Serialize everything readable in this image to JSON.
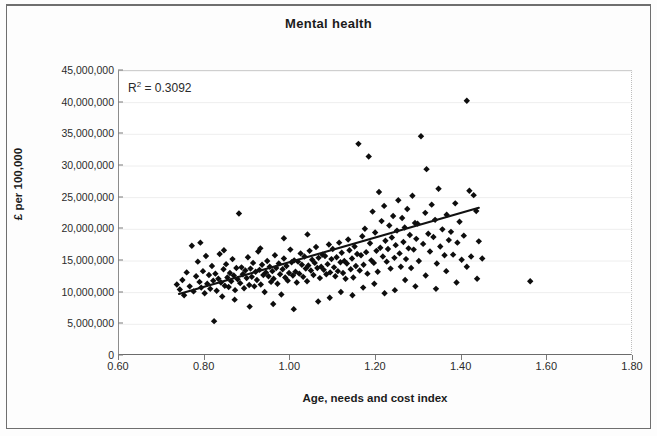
{
  "figure": {
    "title": "Mental health",
    "annotation_prefix": "R",
    "annotation_sup": "2",
    "annotation_value": "= 0.3092",
    "annotation_full": "R2 = 0.3092"
  },
  "axes": {
    "x_title": "Age, needs and cost index",
    "y_title": "£ per 100,000",
    "x_ticks": [
      "0.60",
      "0.80",
      "1.00",
      "1.20",
      "1.40",
      "1.60",
      "1.80"
    ],
    "y_ticks": [
      "0",
      "5,000,000",
      "10,000,000",
      "15,000,000",
      "20,000,000",
      "25,000,000",
      "30,000,000",
      "35,000,000",
      "40,000,000",
      "45,000,000"
    ]
  },
  "colors": {
    "marker": "#0d0d0d",
    "trendline": "#111111",
    "gridline": "#eeeeee",
    "frame": "#6f6f6f",
    "text": "#1b1b1b"
  },
  "chart_data": {
    "type": "scatter",
    "title": "Mental health",
    "xlabel": "Age, needs and cost index",
    "ylabel": "£ per 100,000",
    "xlim": [
      0.6,
      1.8
    ],
    "ylim": [
      0,
      45000000
    ],
    "xticks": [
      0.6,
      0.8,
      1.0,
      1.2,
      1.4,
      1.6,
      1.8
    ],
    "yticks": [
      0,
      5000000,
      10000000,
      15000000,
      20000000,
      25000000,
      30000000,
      35000000,
      40000000,
      45000000
    ],
    "grid": true,
    "legend": "none",
    "annotations": [
      {
        "text": "R2 = 0.3092",
        "x": 0.625,
        "y": 42200000,
        "r_squared": 0.3092
      }
    ],
    "trendline": {
      "type": "linear",
      "x_start": 0.74,
      "y_start": 9800000,
      "x_end": 1.44,
      "y_end": 23400000,
      "slope": 19430000,
      "intercept": -4580000
    },
    "marker_style": "diamond",
    "n_points": 236,
    "points": [
      [
        0.735,
        11300000
      ],
      [
        0.742,
        10500000
      ],
      [
        0.748,
        12000000
      ],
      [
        0.752,
        9600000
      ],
      [
        0.758,
        13200000
      ],
      [
        0.765,
        11000000
      ],
      [
        0.77,
        17400000
      ],
      [
        0.774,
        10200000
      ],
      [
        0.78,
        12600000
      ],
      [
        0.784,
        14900000
      ],
      [
        0.788,
        11700000
      ],
      [
        0.792,
        10800000
      ],
      [
        0.796,
        13400000
      ],
      [
        0.8,
        9900000
      ],
      [
        0.803,
        15800000
      ],
      [
        0.806,
        11400000
      ],
      [
        0.81,
        12800000
      ],
      [
        0.813,
        10600000
      ],
      [
        0.817,
        14200000
      ],
      [
        0.82,
        11900000
      ],
      [
        0.822,
        5500000
      ],
      [
        0.825,
        13000000
      ],
      [
        0.828,
        10300000
      ],
      [
        0.832,
        12200000
      ],
      [
        0.835,
        16100000
      ],
      [
        0.838,
        11600000
      ],
      [
        0.841,
        9400000
      ],
      [
        0.844,
        13700000
      ],
      [
        0.847,
        11100000
      ],
      [
        0.85,
        14500000
      ],
      [
        0.853,
        12400000
      ],
      [
        0.856,
        10900000
      ],
      [
        0.859,
        13100000
      ],
      [
        0.862,
        11800000
      ],
      [
        0.865,
        15300000
      ],
      [
        0.868,
        12700000
      ],
      [
        0.871,
        10400000
      ],
      [
        0.874,
        13900000
      ],
      [
        0.877,
        12100000
      ],
      [
        0.88,
        22500000
      ],
      [
        0.883,
        11500000
      ],
      [
        0.886,
        14000000
      ],
      [
        0.889,
        12900000
      ],
      [
        0.892,
        10700000
      ],
      [
        0.895,
        13500000
      ],
      [
        0.898,
        12300000
      ],
      [
        0.901,
        15600000
      ],
      [
        0.904,
        11200000
      ],
      [
        0.907,
        13800000
      ],
      [
        0.91,
        12500000
      ],
      [
        0.913,
        14700000
      ],
      [
        0.916,
        11000000
      ],
      [
        0.919,
        13300000
      ],
      [
        0.922,
        12000000
      ],
      [
        0.925,
        16500000
      ],
      [
        0.928,
        13600000
      ],
      [
        0.931,
        11300000
      ],
      [
        0.934,
        14400000
      ],
      [
        0.937,
        12800000
      ],
      [
        0.94,
        10100000
      ],
      [
        0.943,
        13200000
      ],
      [
        0.946,
        15000000
      ],
      [
        0.949,
        12600000
      ],
      [
        0.952,
        14100000
      ],
      [
        0.955,
        11700000
      ],
      [
        0.958,
        13400000
      ],
      [
        0.961,
        12200000
      ],
      [
        0.964,
        15900000
      ],
      [
        0.967,
        13900000
      ],
      [
        0.97,
        11400000
      ],
      [
        0.973,
        14600000
      ],
      [
        0.976,
        12900000
      ],
      [
        0.979,
        9700000
      ],
      [
        0.982,
        13700000
      ],
      [
        0.985,
        15400000
      ],
      [
        0.988,
        12400000
      ],
      [
        0.991,
        14200000
      ],
      [
        0.994,
        11900000
      ],
      [
        0.997,
        13100000
      ],
      [
        1.0,
        16800000
      ],
      [
        1.003,
        14800000
      ],
      [
        1.006,
        12700000
      ],
      [
        1.009,
        15100000
      ],
      [
        1.012,
        13300000
      ],
      [
        1.015,
        11600000
      ],
      [
        1.018,
        14900000
      ],
      [
        1.021,
        13000000
      ],
      [
        1.024,
        16200000
      ],
      [
        1.027,
        14400000
      ],
      [
        1.03,
        12500000
      ],
      [
        1.033,
        15700000
      ],
      [
        1.036,
        13800000
      ],
      [
        1.039,
        11800000
      ],
      [
        1.042,
        14300000
      ],
      [
        1.045,
        16600000
      ],
      [
        1.048,
        13500000
      ],
      [
        1.051,
        15200000
      ],
      [
        1.054,
        12800000
      ],
      [
        1.057,
        14700000
      ],
      [
        1.06,
        17200000
      ],
      [
        1.063,
        13900000
      ],
      [
        1.066,
        15500000
      ],
      [
        1.069,
        12300000
      ],
      [
        1.072,
        14100000
      ],
      [
        1.075,
        16000000
      ],
      [
        1.078,
        13600000
      ],
      [
        1.081,
        15800000
      ],
      [
        1.084,
        12900000
      ],
      [
        1.087,
        14500000
      ],
      [
        1.09,
        17600000
      ],
      [
        1.093,
        13200000
      ],
      [
        1.096,
        15300000
      ],
      [
        1.099,
        16900000
      ],
      [
        1.102,
        14000000
      ],
      [
        1.105,
        12600000
      ],
      [
        1.108,
        15600000
      ],
      [
        1.111,
        13400000
      ],
      [
        1.114,
        17900000
      ],
      [
        1.117,
        14800000
      ],
      [
        1.12,
        16300000
      ],
      [
        1.123,
        13100000
      ],
      [
        1.126,
        15000000
      ],
      [
        1.129,
        12200000
      ],
      [
        1.132,
        14600000
      ],
      [
        1.135,
        18400000
      ],
      [
        1.138,
        16700000
      ],
      [
        1.141,
        13700000
      ],
      [
        1.144,
        15400000
      ],
      [
        1.147,
        12400000
      ],
      [
        1.15,
        17300000
      ],
      [
        1.153,
        14200000
      ],
      [
        1.156,
        16100000
      ],
      [
        1.159,
        33500000
      ],
      [
        1.162,
        13500000
      ],
      [
        1.165,
        15900000
      ],
      [
        1.168,
        18900000
      ],
      [
        1.171,
        14400000
      ],
      [
        1.174,
        20100000
      ],
      [
        1.177,
        16400000
      ],
      [
        1.18,
        13000000
      ],
      [
        1.183,
        31500000
      ],
      [
        1.186,
        17800000
      ],
      [
        1.189,
        15100000
      ],
      [
        1.192,
        22800000
      ],
      [
        1.195,
        14700000
      ],
      [
        1.198,
        19500000
      ],
      [
        1.201,
        16600000
      ],
      [
        1.204,
        13300000
      ],
      [
        1.207,
        25900000
      ],
      [
        1.21,
        17100000
      ],
      [
        1.213,
        21300000
      ],
      [
        1.216,
        15700000
      ],
      [
        1.219,
        23700000
      ],
      [
        1.222,
        18200000
      ],
      [
        1.225,
        14900000
      ],
      [
        1.228,
        16900000
      ],
      [
        1.231,
        20600000
      ],
      [
        1.234,
        13800000
      ],
      [
        1.237,
        18700000
      ],
      [
        1.24,
        22100000
      ],
      [
        1.243,
        15500000
      ],
      [
        1.246,
        17500000
      ],
      [
        1.249,
        19800000
      ],
      [
        1.252,
        24600000
      ],
      [
        1.255,
        16200000
      ],
      [
        1.258,
        14100000
      ],
      [
        1.261,
        21800000
      ],
      [
        1.264,
        18000000
      ],
      [
        1.267,
        20300000
      ],
      [
        1.27,
        15300000
      ],
      [
        1.273,
        23200000
      ],
      [
        1.276,
        17000000
      ],
      [
        1.279,
        19100000
      ],
      [
        1.282,
        13900000
      ],
      [
        1.285,
        25300000
      ],
      [
        1.288,
        16800000
      ],
      [
        1.291,
        21000000
      ],
      [
        1.294,
        18500000
      ],
      [
        1.297,
        20900000
      ],
      [
        1.3,
        15000000
      ],
      [
        1.305,
        34700000
      ],
      [
        1.31,
        17700000
      ],
      [
        1.315,
        22600000
      ],
      [
        1.318,
        29500000
      ],
      [
        1.322,
        19300000
      ],
      [
        1.326,
        16500000
      ],
      [
        1.33,
        23900000
      ],
      [
        1.334,
        18800000
      ],
      [
        1.338,
        21500000
      ],
      [
        1.342,
        14600000
      ],
      [
        1.346,
        26400000
      ],
      [
        1.35,
        17300000
      ],
      [
        1.355,
        20000000
      ],
      [
        1.36,
        15900000
      ],
      [
        1.365,
        22300000
      ],
      [
        1.37,
        18300000
      ],
      [
        1.375,
        19600000
      ],
      [
        1.38,
        16000000
      ],
      [
        1.385,
        24100000
      ],
      [
        1.39,
        17900000
      ],
      [
        1.395,
        21200000
      ],
      [
        1.4,
        15200000
      ],
      [
        1.405,
        19000000
      ],
      [
        1.412,
        40300000
      ],
      [
        1.418,
        26100000
      ],
      [
        1.422,
        15700000
      ],
      [
        1.428,
        25400000
      ],
      [
        1.434,
        22900000
      ],
      [
        1.44,
        18100000
      ],
      [
        1.448,
        15400000
      ],
      [
        1.56,
        11800000
      ],
      [
        0.79,
        17900000
      ],
      [
        0.845,
        16700000
      ],
      [
        0.87,
        8900000
      ],
      [
        0.905,
        7800000
      ],
      [
        0.93,
        17000000
      ],
      [
        0.96,
        8200000
      ],
      [
        0.985,
        18600000
      ],
      [
        1.008,
        7400000
      ],
      [
        1.04,
        19200000
      ],
      [
        1.065,
        8600000
      ],
      [
        1.092,
        9200000
      ],
      [
        1.118,
        10100000
      ],
      [
        1.145,
        9600000
      ],
      [
        1.17,
        10800000
      ],
      [
        1.196,
        11400000
      ],
      [
        1.22,
        9900000
      ],
      [
        1.244,
        10400000
      ],
      [
        1.268,
        12000000
      ],
      [
        1.292,
        11000000
      ],
      [
        1.316,
        12700000
      ],
      [
        1.34,
        10600000
      ],
      [
        1.364,
        13400000
      ],
      [
        1.388,
        11600000
      ],
      [
        1.412,
        14100000
      ],
      [
        1.436,
        12200000
      ]
    ]
  }
}
